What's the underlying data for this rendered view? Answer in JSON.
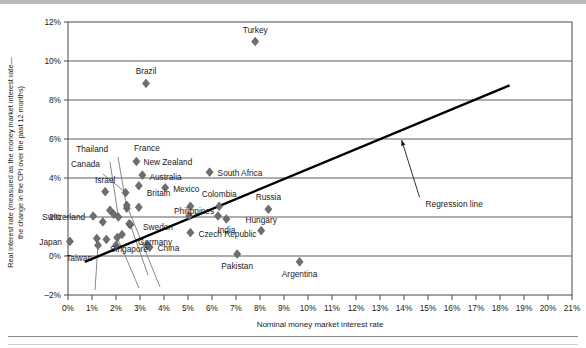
{
  "chart_data": {
    "type": "scatter",
    "title": "",
    "xlabel": "Nominal money market interest rate",
    "ylabel": "Real interest rate (measured as the money market interest rate—the change in the CPI over the past 12 months)",
    "xlim": [
      0,
      21
    ],
    "ylim": [
      -2,
      12
    ],
    "xticks": [
      "0%",
      "1%",
      "2%",
      "3%",
      "4%",
      "5%",
      "6%",
      "7%",
      "8%",
      "9%",
      "10%",
      "11%",
      "12%",
      "13%",
      "14%",
      "15%",
      "16%",
      "17%",
      "18%",
      "19%",
      "20%",
      "21%"
    ],
    "yticks": [
      "-2%",
      "0%",
      "2%",
      "4%",
      "6%",
      "8%",
      "10%",
      "12%"
    ],
    "grid": "horizontal",
    "legend_position": "none",
    "marker_color": "#6e6e6e",
    "line_color": "#000000",
    "annotations": [
      {
        "text": "Regression line",
        "x": 14.9,
        "y": 2.7,
        "arrow_to_x": 13.9,
        "arrow_to_y": 5.95
      }
    ],
    "series": [
      {
        "name": "Countries",
        "points": [
          {
            "label": "Turkey",
            "x": 7.8,
            "y": 11.0,
            "label_dx": 0,
            "label_dy": -9,
            "anchor": "middle",
            "leader": false
          },
          {
            "label": "Brazil",
            "x": 3.25,
            "y": 8.85,
            "label_dx": 0,
            "label_dy": -9,
            "anchor": "middle",
            "leader": false
          },
          {
            "label": "New Zealand",
            "x": 2.85,
            "y": 4.85,
            "label_dx": 7,
            "label_dy": 3.5,
            "anchor": "start",
            "leader": false
          },
          {
            "label": "France",
            "x": 2.45,
            "y": 2.45,
            "label_dx": 0,
            "label_dy": 0,
            "anchor": "start",
            "leader": true,
            "lx": 118,
            "ly": 157,
            "tx": 134,
            "ty": 151
          },
          {
            "label": "Thailand",
            "x": 2.1,
            "y": 2.0,
            "label_dx": 0,
            "label_dy": 0,
            "anchor": "end",
            "leader": true,
            "lx": 110,
            "ly": 162,
            "tx": 108,
            "ty": 152
          },
          {
            "label": "Canada",
            "x": 2.4,
            "y": 3.25,
            "label_dx": 0,
            "label_dy": 0,
            "anchor": "end",
            "leader": true,
            "lx": 103,
            "ly": 174,
            "tx": 100,
            "ty": 167
          },
          {
            "label": "Australia",
            "x": 3.1,
            "y": 4.15,
            "label_dx": 7,
            "label_dy": 4.5,
            "anchor": "start",
            "leader": false
          },
          {
            "label": "South Africa",
            "x": 5.9,
            "y": 4.3,
            "label_dx": 8,
            "label_dy": 4,
            "anchor": "start",
            "leader": false
          },
          {
            "label": "Israel",
            "x": 1.55,
            "y": 3.3,
            "label_dx": 0,
            "label_dy": -9,
            "anchor": "middle",
            "leader": false
          },
          {
            "label": "Mexico",
            "x": 4.05,
            "y": 3.5,
            "label_dx": 8,
            "label_dy": 4,
            "anchor": "start",
            "leader": false
          },
          {
            "label": "Britain",
            "x": 2.95,
            "y": 3.6,
            "label_dx": 8,
            "label_dy": 10,
            "anchor": "start",
            "leader": false
          },
          {
            "label": "Philippines",
            "x": 5.1,
            "y": 2.55,
            "label_dx": 0,
            "label_dy": 0,
            "anchor": "start",
            "leader": false,
            "labx": 174,
            "laby": 214
          },
          {
            "label": "Colombia",
            "x": 6.3,
            "y": 2.55,
            "label_dx": 0,
            "label_dy": -9,
            "anchor": "middle",
            "leader": false
          },
          {
            "label": "Russia",
            "x": 8.35,
            "y": 2.4,
            "label_dx": 0,
            "label_dy": -9,
            "anchor": "middle",
            "leader": false
          },
          {
            "label": "Switzerland",
            "x": 1.05,
            "y": 2.05,
            "label_dx": -8,
            "label_dy": 4,
            "anchor": "end",
            "leader": false
          },
          {
            "label": "Japan",
            "x": 0.08,
            "y": 0.75,
            "label_dx": -8,
            "label_dy": 4,
            "anchor": "end",
            "leader": false
          },
          {
            "label": "Czech Republic",
            "x": 5.1,
            "y": 1.2,
            "label_dx": 8,
            "label_dy": 4,
            "anchor": "start",
            "leader": false
          },
          {
            "label": "China",
            "x": 3.4,
            "y": 0.45,
            "label_dx": 8,
            "label_dy": 4,
            "anchor": "start",
            "leader": false
          },
          {
            "label": "India",
            "x": 6.6,
            "y": 1.9,
            "label_dx": 0,
            "label_dy": 14,
            "anchor": "middle",
            "leader": false
          },
          {
            "label": "Hungary",
            "x": 8.05,
            "y": 1.3,
            "label_dx": 0,
            "label_dy": -8,
            "anchor": "middle",
            "leader": false
          },
          {
            "label": "Pakistan",
            "x": 7.05,
            "y": 0.1,
            "label_dx": 0,
            "label_dy": 15,
            "anchor": "middle",
            "leader": false
          },
          {
            "label": "Argentina",
            "x": 9.65,
            "y": -0.3,
            "label_dx": 0,
            "label_dy": 15,
            "anchor": "middle",
            "leader": false
          },
          {
            "label": "Taiwan",
            "x": 1.25,
            "y": 0.55,
            "label_dx": 0,
            "label_dy": 0,
            "anchor": "end",
            "leader": true,
            "lx": 95,
            "ly": 290,
            "tx": 92,
            "ty": 261
          },
          {
            "label": "Singapore",
            "x": 2.05,
            "y": 0.95,
            "label_dx": 0,
            "label_dy": 0,
            "anchor": "middle",
            "leader": true,
            "lx": 139,
            "ly": 288,
            "tx": 129,
            "ty": 252
          },
          {
            "label": "Germany",
            "x": 2.6,
            "y": 1.6,
            "label_dx": 0,
            "label_dy": 0,
            "anchor": "start",
            "leader": true,
            "lx": 148,
            "ly": 275,
            "tx": 138,
            "ty": 245
          },
          {
            "label": "Sweden",
            "x": 2.45,
            "y": 2.6,
            "label_dx": 0,
            "label_dy": 0,
            "anchor": "start",
            "leader": true,
            "lx": 160,
            "ly": 287,
            "tx": 143,
            "ty": 230
          },
          {
            "label": "unlabeled-1",
            "x": 1.75,
            "y": 2.35,
            "label_dx": 0,
            "label_dy": 0,
            "anchor": "middle",
            "leader": false,
            "hide_label": true
          },
          {
            "label": "unlabeled-2",
            "x": 1.9,
            "y": 2.15,
            "label_dx": 0,
            "label_dy": 0,
            "anchor": "middle",
            "leader": false,
            "hide_label": true
          },
          {
            "label": "unlabeled-3",
            "x": 1.45,
            "y": 1.75,
            "label_dx": 0,
            "label_dy": 0,
            "anchor": "middle",
            "leader": false,
            "hide_label": true
          },
          {
            "label": "unlabeled-4",
            "x": 1.2,
            "y": 0.9,
            "label_dx": 0,
            "label_dy": 0,
            "anchor": "middle",
            "leader": false,
            "hide_label": true
          },
          {
            "label": "unlabeled-5",
            "x": 1.6,
            "y": 0.85,
            "label_dx": 0,
            "label_dy": 0,
            "anchor": "middle",
            "leader": false,
            "hide_label": true
          },
          {
            "label": "unlabeled-6",
            "x": 2.0,
            "y": 0.55,
            "label_dx": 0,
            "label_dy": 0,
            "anchor": "middle",
            "leader": false,
            "hide_label": true
          },
          {
            "label": "unlabeled-7",
            "x": 2.25,
            "y": 1.1,
            "label_dx": 0,
            "label_dy": 0,
            "anchor": "middle",
            "leader": false,
            "hide_label": true
          },
          {
            "label": "unlabeled-8",
            "x": 3.3,
            "y": 0.55,
            "label_dx": 0,
            "label_dy": 0,
            "anchor": "middle",
            "leader": false,
            "hide_label": true
          },
          {
            "label": "unlabeled-9",
            "x": 2.95,
            "y": 2.5,
            "label_dx": 0,
            "label_dy": 0,
            "anchor": "middle",
            "leader": false,
            "hide_label": true
          },
          {
            "label": "unlabeled-10",
            "x": 2.55,
            "y": 1.65,
            "label_dx": 0,
            "label_dy": 0,
            "anchor": "middle",
            "leader": false,
            "hide_label": true
          },
          {
            "label": "unlabeled-11",
            "x": 5.05,
            "y": 2.05,
            "label_dx": 0,
            "label_dy": 0,
            "anchor": "middle",
            "leader": false,
            "hide_label": true
          },
          {
            "label": "unlabeled-12",
            "x": 6.25,
            "y": 2.05,
            "label_dx": 0,
            "label_dy": 0,
            "anchor": "middle",
            "leader": false,
            "hide_label": true
          }
        ]
      }
    ],
    "regression_line": {
      "x1": 0.7,
      "y1": -0.3,
      "x2": 18.4,
      "y2": 8.75
    }
  }
}
